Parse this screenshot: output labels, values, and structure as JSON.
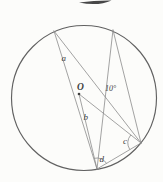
{
  "diagram": {
    "type": "circle-theorem-figure",
    "circle": {
      "cx": 84,
      "cy": 98,
      "r": 72.5
    },
    "center_point": {
      "x": 79,
      "y": 94
    },
    "points_on_circle": {
      "top_left": {
        "x": 54,
        "y": 31
      },
      "top_right": {
        "x": 113,
        "y": 30
      },
      "bottom": {
        "x": 97,
        "y": 169
      },
      "bottom_right": {
        "x": 141,
        "y": 143
      }
    },
    "labels": {
      "angle_a": "a",
      "angle_b": "b",
      "angle_c": "c",
      "angle_d": "d",
      "center": "O",
      "given_angle": "10°"
    },
    "colors": {
      "background": "#fcfcfa",
      "circle_stroke": "#616161",
      "chord_line": "#8c8c8c",
      "text": "#3f3f3f",
      "page_fragment": "#474747"
    }
  }
}
